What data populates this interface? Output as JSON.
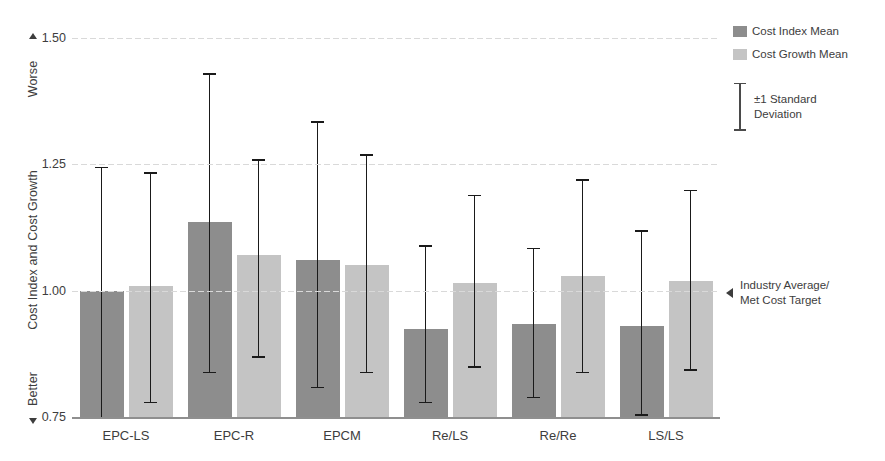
{
  "chart_data": {
    "type": "bar",
    "title": "",
    "xlabel": "",
    "ylabel": "Cost Index and Cost Growth",
    "ylim": [
      0.75,
      1.5
    ],
    "yticks": [
      "1.50",
      "1.25",
      "1.00",
      "0.75"
    ],
    "ytick_values": [
      1.5,
      1.25,
      1.0,
      0.75
    ],
    "grid": true,
    "legend_position": "top-right",
    "categories": [
      "EPC-LS",
      "EPC-R",
      "EPCM",
      "Re/LS",
      "Re/Re",
      "LS/LS"
    ],
    "series": [
      {
        "name": "Cost Index Mean",
        "color": "#8d8d8d",
        "values": [
          1.0,
          1.135,
          1.06,
          0.925,
          0.935,
          0.93
        ],
        "error_low": [
          0.75,
          0.84,
          0.81,
          0.78,
          0.79,
          0.755
        ],
        "error_high": [
          1.245,
          1.43,
          1.335,
          1.09,
          1.085,
          1.12
        ]
      },
      {
        "name": "Cost Growth Mean",
        "color": "#c4c4c4",
        "values": [
          1.01,
          1.07,
          1.05,
          1.015,
          1.03,
          1.02
        ],
        "error_low": [
          0.78,
          0.87,
          0.84,
          0.85,
          0.84,
          0.845
        ],
        "error_high": [
          1.235,
          1.26,
          1.27,
          1.19,
          1.22,
          1.2
        ]
      }
    ],
    "annotations": [
      {
        "name": "industry-average",
        "value": 1.0,
        "text": "Industry Average/\nMet Cost Target"
      }
    ]
  },
  "axis": {
    "worse_label": "Worse",
    "better_label": "Better",
    "title": "Cost Index and Cost Growth"
  },
  "legend": {
    "items": [
      {
        "label": "Cost Index Mean",
        "swatch": "dark"
      },
      {
        "label": "Cost Growth Mean",
        "swatch": "light"
      }
    ],
    "std_label_line1": "±1 Standard",
    "std_label_line2": "Deviation"
  },
  "annotation": {
    "line1": "Industry Average/",
    "line2": "Met Cost Target"
  }
}
